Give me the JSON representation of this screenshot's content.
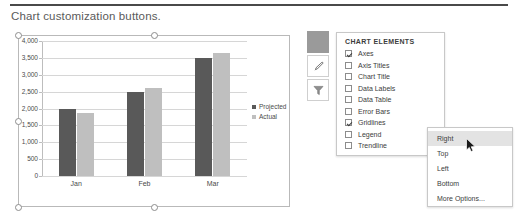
{
  "caption": "Chart customization buttons.",
  "chart_data": {
    "type": "bar",
    "title": "",
    "xlabel": "",
    "ylabel": "",
    "categories": [
      "Jan",
      "Feb",
      "Mar"
    ],
    "series": [
      {
        "name": "Projected",
        "color": "#595959",
        "values": [
          2000,
          2500,
          3500
        ]
      },
      {
        "name": "Actual",
        "color": "#bfbfbf",
        "values": [
          1870,
          2620,
          3650
        ]
      }
    ],
    "ylim": [
      0,
      4000
    ],
    "yticks": [
      "0",
      "500",
      "1,000",
      "1,500",
      "2,000",
      "2,500",
      "3,000",
      "3,500",
      "4,000"
    ],
    "ytick_values": [
      0,
      500,
      1000,
      1500,
      2000,
      2500,
      3000,
      3500,
      4000
    ],
    "grid": true,
    "legend_position": "right"
  },
  "side_buttons": [
    {
      "name": "chart-elements",
      "icon": "plus-icon",
      "selected": true
    },
    {
      "name": "chart-styles",
      "icon": "brush-icon",
      "selected": false
    },
    {
      "name": "chart-filters",
      "icon": "funnel-icon",
      "selected": false
    }
  ],
  "panel": {
    "title": "CHART ELEMENTS",
    "items": [
      {
        "label": "Axes",
        "checked": true,
        "submenu": false
      },
      {
        "label": "Axis Titles",
        "checked": false,
        "submenu": false
      },
      {
        "label": "Chart Title",
        "checked": false,
        "submenu": false
      },
      {
        "label": "Data Labels",
        "checked": false,
        "submenu": false
      },
      {
        "label": "Data Table",
        "checked": false,
        "submenu": false
      },
      {
        "label": "Error Bars",
        "checked": false,
        "submenu": false
      },
      {
        "label": "Gridlines",
        "checked": true,
        "submenu": false
      },
      {
        "label": "Legend",
        "checked": false,
        "submenu": true
      },
      {
        "label": "Trendline",
        "checked": false,
        "submenu": false
      }
    ]
  },
  "submenu": {
    "items": [
      {
        "label": "Right",
        "highlighted": true
      },
      {
        "label": "Top",
        "highlighted": false
      },
      {
        "label": "Left",
        "highlighted": false
      },
      {
        "label": "Bottom",
        "highlighted": false
      },
      {
        "label": "More Options...",
        "highlighted": false
      }
    ]
  },
  "colors": {
    "rule": "#4a4a4a",
    "caption_text": "#5a5a5a",
    "projected": "#595959",
    "actual": "#bfbfbf",
    "gridline": "#d6d6d6",
    "highlight": "#e3e3e3"
  }
}
